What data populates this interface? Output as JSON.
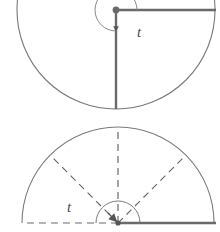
{
  "figure": {
    "background_color": "#ffffff",
    "stroke_color": "#6e6e6e",
    "accent_stroke_color": "#555555",
    "label_color": "#4a4a4a",
    "panels": [
      {
        "name": "upper-panel",
        "description": "Large circle with initial ray to the right and terminal ray pointing down; clockwise-drawn arc sweeping 270 degrees labeled t",
        "center": {
          "x": 116,
          "y": 10
        },
        "radius": 99,
        "arc_radius": 21,
        "initial_ray_angle_deg": 0,
        "terminal_ray_angle_deg": 270,
        "sweep_deg": 270,
        "sweep_direction": "counterclockwise",
        "angle_label": "t",
        "angle_label_pos": {
          "x": 137,
          "y": 37
        },
        "arrowhead": true
      },
      {
        "name": "lower-panel",
        "description": "Large upper semicircle with dashed rays at 0, 45, 90, 135 and 180 degrees, inner dashed semicircle, solid baseline to the right, angle label t",
        "center": {
          "x": 118,
          "y": 223
        },
        "radius": 96,
        "inner_radius": 22,
        "ray_angles_deg": [
          0,
          45,
          90,
          135,
          180
        ],
        "dashed_rays": true,
        "baseline_left_dashed": true,
        "baseline_right_solid": true,
        "angle_label": "t",
        "angle_label_pos": {
          "x": 73,
          "y": 212
        },
        "arrowhead": true
      }
    ]
  },
  "labels": {
    "upper_t": "t",
    "lower_t": "t"
  }
}
